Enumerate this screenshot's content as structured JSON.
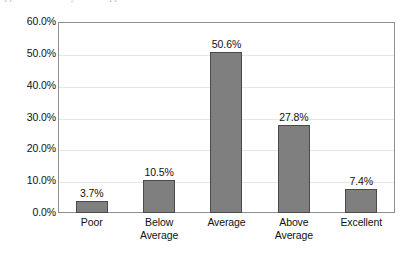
{
  "scan": {
    "top_artifact_text": "appearance of very faint clipped text"
  },
  "chart_data": {
    "type": "bar",
    "title": "",
    "subtitle": "",
    "xlabel": "",
    "ylabel": "",
    "categories": [
      "Poor",
      "Below Average",
      "Average",
      "Above Average",
      "Excellent"
    ],
    "category_lines": [
      [
        "Poor"
      ],
      [
        "Below",
        "Average"
      ],
      [
        "Average"
      ],
      [
        "Above",
        "Average"
      ],
      [
        "Excellent"
      ]
    ],
    "values": [
      3.7,
      10.5,
      50.6,
      27.8,
      7.4
    ],
    "data_labels": [
      "3.7%",
      "10.5%",
      "50.6%",
      "27.8%",
      "7.4%"
    ],
    "ylim": [
      0,
      60
    ],
    "ytick_values": [
      60,
      50,
      40,
      30,
      20,
      10,
      0
    ],
    "ytick_labels": [
      "60.0%",
      "50.0%",
      "40.0%",
      "30.0%",
      "20.0%",
      "10.0%",
      "0.0%"
    ],
    "grid": true,
    "grid_axis": "y",
    "legend": false,
    "legend_position": "none",
    "bar_color": "#7f7f7f",
    "bar_border_color": "#4a4a4a",
    "plot_border_color": "#8d8d92",
    "gridline_color": "#e6e6e8",
    "background_color": "#ffffff",
    "text_color": "#111111"
  }
}
